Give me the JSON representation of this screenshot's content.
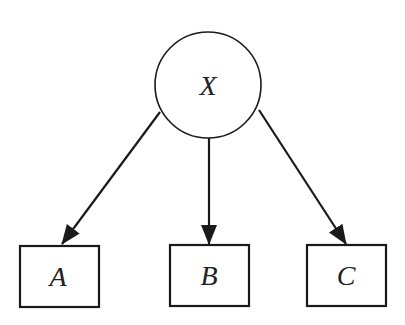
{
  "diagram": {
    "type": "directed-graph",
    "colors": {
      "stroke": "#1a1a1a",
      "fill": "#ffffff",
      "text": "#222222"
    },
    "nodes": [
      {
        "id": "X",
        "label": "X",
        "shape": "circle"
      },
      {
        "id": "A",
        "label": "A",
        "shape": "rectangle"
      },
      {
        "id": "B",
        "label": "B",
        "shape": "rectangle"
      },
      {
        "id": "C",
        "label": "C",
        "shape": "rectangle"
      }
    ],
    "edges": [
      {
        "from": "X",
        "to": "A"
      },
      {
        "from": "X",
        "to": "B"
      },
      {
        "from": "X",
        "to": "C"
      }
    ]
  }
}
